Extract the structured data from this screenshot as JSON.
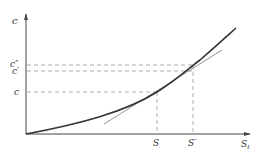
{
  "diagram": {
    "type": "cost-curve",
    "axes": {
      "y_label": "c",
      "x_label": "S",
      "x_label_subscript": "t"
    },
    "y_levels": [
      {
        "name": "c-double-prime",
        "label": "c″",
        "y": 65
      },
      {
        "name": "c-prime",
        "label": "c′",
        "y": 71
      },
      {
        "name": "c",
        "label": "c",
        "y": 92
      }
    ],
    "x_points": [
      {
        "name": "S",
        "label": "S",
        "x": 157
      },
      {
        "name": "S-prime",
        "label": "S′",
        "x": 193
      }
    ],
    "curve": "convex increasing cost curve from origin",
    "tangent": "tangent line at point (S, c)",
    "colors": {
      "axis": "#444444",
      "curve": "#333333",
      "tangent": "#888888",
      "dashed": "#999999",
      "label": "#333333"
    }
  }
}
